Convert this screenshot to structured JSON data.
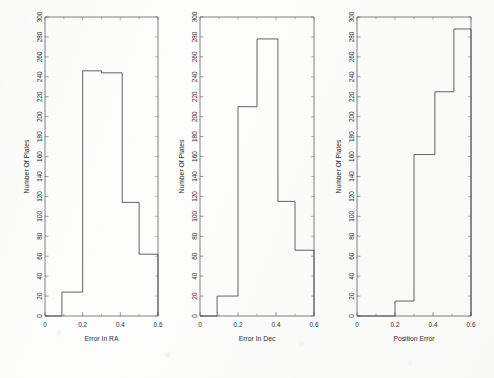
{
  "figure": {
    "kind": "scanned-figure",
    "background_color": "#fdfdfb",
    "line_color": "#3a3a46",
    "axis_color": "#55555f",
    "text_color": "#2b2b33"
  },
  "chart_data": [
    {
      "type": "bar",
      "title": "",
      "xlabel": "Error In RA",
      "ylabel": "Number Of Plates",
      "xlim": [
        0,
        0.6
      ],
      "ylim": [
        0,
        300
      ],
      "xticks": [
        "0",
        "0.2",
        "0.4",
        "0.6"
      ],
      "xtick_values": [
        0,
        0.2,
        0.4,
        0.6
      ],
      "yticks": [
        "0",
        "20",
        "40",
        "60",
        "80",
        "100",
        "120",
        "140",
        "160",
        "180",
        "200",
        "220",
        "240",
        "260",
        "280",
        "300"
      ],
      "ytick_values": [
        0,
        20,
        40,
        60,
        80,
        100,
        120,
        140,
        160,
        180,
        200,
        220,
        240,
        260,
        280,
        300
      ],
      "grid": false,
      "legend": "none",
      "bin_edges": [
        0,
        0.09,
        0.2,
        0.3,
        0.41,
        0.5,
        0.6
      ],
      "categories": [
        "0.00-0.09",
        "0.09-0.20",
        "0.20-0.30",
        "0.30-0.41",
        "0.41-0.50",
        "0.50-0.60"
      ],
      "values": [
        0,
        24,
        246,
        244,
        114,
        62
      ]
    },
    {
      "type": "bar",
      "title": "",
      "xlabel": "Error In Dec",
      "ylabel": "Number Of Plates",
      "xlim": [
        0,
        0.6
      ],
      "ylim": [
        0,
        300
      ],
      "xticks": [
        "0",
        "0.2",
        "0.4",
        "0.6"
      ],
      "xtick_values": [
        0,
        0.2,
        0.4,
        0.6
      ],
      "yticks": [
        "0",
        "20",
        "40",
        "60",
        "80",
        "100",
        "120",
        "140",
        "160",
        "180",
        "200",
        "220",
        "240",
        "260",
        "280",
        "300"
      ],
      "ytick_values": [
        0,
        20,
        40,
        60,
        80,
        100,
        120,
        140,
        160,
        180,
        200,
        220,
        240,
        260,
        280,
        300
      ],
      "grid": false,
      "legend": "none",
      "bin_edges": [
        0,
        0.09,
        0.2,
        0.3,
        0.41,
        0.5,
        0.6
      ],
      "categories": [
        "0.00-0.09",
        "0.09-0.20",
        "0.20-0.30",
        "0.30-0.41",
        "0.41-0.50",
        "0.50-0.60"
      ],
      "values": [
        0,
        20,
        210,
        278,
        115,
        66
      ]
    },
    {
      "type": "bar",
      "title": "",
      "xlabel": "Position Error",
      "ylabel": "Number Of Plates",
      "xlim": [
        0,
        0.6
      ],
      "ylim": [
        0,
        300
      ],
      "xticks": [
        "0",
        "0.2",
        "0.4",
        "0.6"
      ],
      "xtick_values": [
        0,
        0.2,
        0.4,
        0.6
      ],
      "yticks": [
        "0",
        "20",
        "40",
        "60",
        "80",
        "100",
        "120",
        "140",
        "160",
        "180",
        "200",
        "220",
        "240",
        "260",
        "280",
        "300"
      ],
      "ytick_values": [
        0,
        20,
        40,
        60,
        80,
        100,
        120,
        140,
        160,
        180,
        200,
        220,
        240,
        260,
        280,
        300
      ],
      "grid": false,
      "legend": "none",
      "bin_edges": [
        0,
        0.2,
        0.3,
        0.41,
        0.51,
        0.6
      ],
      "categories": [
        "0.00-0.20",
        "0.20-0.30",
        "0.30-0.41",
        "0.41-0.51",
        "0.51-0.60"
      ],
      "values": [
        0,
        15,
        162,
        225,
        288
      ]
    }
  ]
}
